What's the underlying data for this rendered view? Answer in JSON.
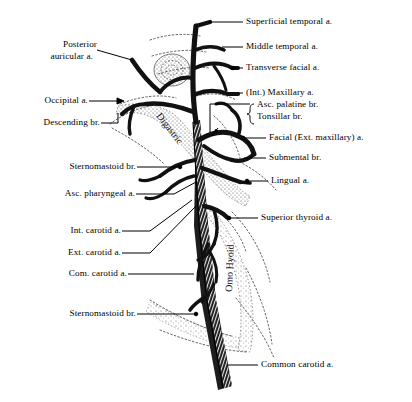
{
  "figure": {
    "background": "#ffffff",
    "ink": "#000000",
    "width": 412,
    "height": 402
  },
  "labels_right": [
    {
      "id": "superficial-temporal",
      "text": "Superficial temporal a.",
      "x": 246,
      "y": 22
    },
    {
      "id": "middle-temporal",
      "text": "Middle temporal a.",
      "x": 246,
      "y": 46
    },
    {
      "id": "transverse-facial",
      "text": "Transverse facial a.",
      "x": 246,
      "y": 68
    },
    {
      "id": "int-maxillary",
      "text": "(Int.) Maxillary a.",
      "x": 246,
      "y": 93
    },
    {
      "id": "asc-palatine-br",
      "text": "Asc. palatine br.",
      "x": 256,
      "y": 108
    },
    {
      "id": "tonsillar-br",
      "text": "Tonsillar br.",
      "x": 256,
      "y": 119
    },
    {
      "id": "facial-ext-maxillary",
      "text": "Facial (Ext. maxillary) a.",
      "x": 270,
      "y": 137
    },
    {
      "id": "submental-br",
      "text": "Submental br.",
      "x": 270,
      "y": 158
    },
    {
      "id": "lingual",
      "text": "Lingual a.",
      "x": 272,
      "y": 180
    },
    {
      "id": "superior-thyroid",
      "text": "Superior thyroid a.",
      "x": 262,
      "y": 218
    },
    {
      "id": "common-carotid",
      "text": "Common carotid a.",
      "x": 262,
      "y": 364
    }
  ],
  "labels_left": [
    {
      "id": "posterior-auricular",
      "line1": "Posterior",
      "line2": "auricular a.",
      "x": 22,
      "y": 45
    },
    {
      "id": "occipital",
      "text": "Occipital a.",
      "x": 22,
      "y": 100
    },
    {
      "id": "descending-br",
      "text": "Descending br.",
      "x": 22,
      "y": 123
    },
    {
      "id": "sternomastoid-br-upper",
      "text": "Sternomastoid br.",
      "x": 40,
      "y": 167
    },
    {
      "id": "asc-pharyngeal",
      "text": "Asc. pharyngeal a.",
      "x": 32,
      "y": 194
    },
    {
      "id": "int-carotid",
      "text": "Int. carotid a.",
      "x": 40,
      "y": 230
    },
    {
      "id": "ext-carotid",
      "text": "Ext. carotid a.",
      "x": 40,
      "y": 252
    },
    {
      "id": "com-carotid",
      "text": "Com. carotid a.",
      "x": 40,
      "y": 273
    },
    {
      "id": "sternomastoid-br-lower",
      "text": "Sternomastoid br.",
      "x": 40,
      "y": 313
    }
  ],
  "muscle_labels": [
    {
      "id": "digastric",
      "text": "Digastric",
      "note": "along stippled muscle band, rotated"
    },
    {
      "id": "omo-hyoid",
      "text": "Omo Hyoid",
      "note": "vertical along stippled band"
    }
  ],
  "structures": [
    {
      "id": "parotid-gland",
      "kind": "stippled-oval"
    },
    {
      "id": "carotid-trunk",
      "kind": "hatched-vessel"
    }
  ]
}
